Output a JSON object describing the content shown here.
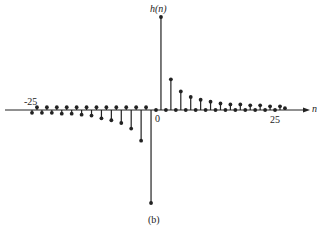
{
  "chart_data": {
    "type": "stem",
    "title": "",
    "ylabel": "h(n)",
    "xlabel": "n",
    "caption": "(b)",
    "x_tick_labels": [
      "-25",
      "0",
      "25"
    ],
    "grid": false,
    "legend": null,
    "xlim": [
      -25,
      26
    ],
    "ylim": [
      -1,
      1
    ],
    "x": [
      -25,
      -24,
      -23,
      -22,
      -21,
      -20,
      -19,
      -18,
      -17,
      -16,
      -15,
      -14,
      -13,
      -12,
      -11,
      -10,
      -9,
      -8,
      -7,
      -6,
      -5,
      -4,
      -3,
      -2,
      -1,
      0,
      1,
      2,
      3,
      4,
      5,
      6,
      7,
      8,
      9,
      10,
      11,
      12,
      13,
      14,
      15,
      16,
      17,
      18,
      19,
      20,
      21,
      22,
      23,
      24,
      25,
      26
    ],
    "values": [
      -0.03,
      0.03,
      -0.03,
      0.03,
      -0.03,
      0.03,
      -0.04,
      0.03,
      -0.04,
      0.03,
      -0.05,
      0.03,
      -0.06,
      0.03,
      -0.09,
      0.03,
      -0.11,
      0.03,
      -0.14,
      0.03,
      -0.2,
      0.03,
      -0.33,
      0.03,
      -1.0,
      0.0,
      1.0,
      0.0,
      0.33,
      0.0,
      0.2,
      0.0,
      0.14,
      0.0,
      0.11,
      0.0,
      0.09,
      0.0,
      0.07,
      0.0,
      0.06,
      0.0,
      0.06,
      0.0,
      0.05,
      0.0,
      0.05,
      0.0,
      0.04,
      0.0,
      0.04,
      0.02
    ]
  }
}
